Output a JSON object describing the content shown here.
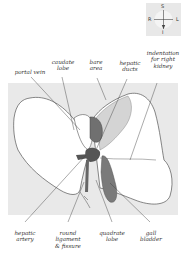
{
  "compass": {
    "top": "S",
    "bottom": "I",
    "left": "R",
    "right": "L"
  },
  "labels": {
    "portal_vein": "portal vein",
    "caudate_lobe": "caudate\nlobe",
    "bare_area": "bare\narea",
    "hepatic_ducts": "hepatic\nducts",
    "indentation": "indentation\nfor right\nkidney",
    "hepatic_artery": "hepatic\nartery",
    "round_ligament": "round\nligament\n& fissure",
    "quadrate_lobe": "quadrate\nlobe",
    "gall_bladder": "gall\nbladder"
  },
  "colors": {
    "panel": "#e9e9e9",
    "organ_fill": "#ffffff",
    "outline": "#555555",
    "dark": "#6e6e6e",
    "bare_area": "#d4d4d4"
  }
}
